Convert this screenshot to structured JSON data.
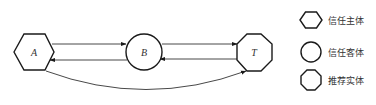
{
  "diagram": {
    "nodes": [
      {
        "id": "A",
        "label": "A",
        "shape": "hexagon",
        "role": "trust-subject"
      },
      {
        "id": "B",
        "label": "B",
        "shape": "circle",
        "role": "trust-object"
      },
      {
        "id": "T",
        "label": "T",
        "shape": "octagon",
        "role": "recommending-entity"
      }
    ],
    "edges": [
      {
        "from": "A",
        "to": "B"
      },
      {
        "from": "B",
        "to": "A"
      },
      {
        "from": "B",
        "to": "T"
      },
      {
        "from": "T",
        "to": "B"
      },
      {
        "from": "A",
        "to": "T",
        "style": "curved"
      }
    ]
  },
  "legend": {
    "items": [
      {
        "shape": "hexagon",
        "label": "信任主体"
      },
      {
        "shape": "circle",
        "label": "信任客体"
      },
      {
        "shape": "octagon",
        "label": "推荐实体"
      }
    ]
  },
  "colors": {
    "stroke": "#1a1a1a",
    "background": "#ffffff"
  }
}
